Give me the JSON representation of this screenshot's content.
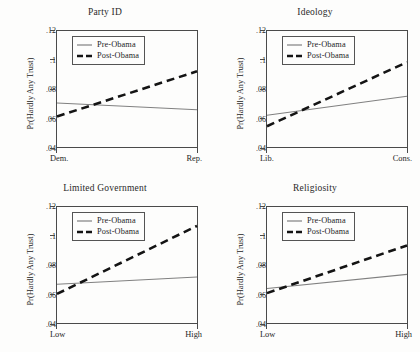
{
  "figure": {
    "legend_labels": {
      "pre": "Pre-Obama",
      "post": "Post-Obama"
    },
    "series_colors": {
      "pre": "#808080",
      "post": "#141414"
    }
  },
  "chart_data": [
    {
      "type": "line",
      "title": "Party ID",
      "xlabel": "",
      "ylabel": "Pr(Hardly Any Trust)",
      "x": [
        0,
        1
      ],
      "xtick_labels": [
        "Dem.",
        "Rep."
      ],
      "ytick_labels": [
        ".04",
        ".06",
        ".08",
        ".1",
        ".12"
      ],
      "ytick_values": [
        0.04,
        0.06,
        0.08,
        0.1,
        0.12
      ],
      "ylim": [
        0.032,
        0.127
      ],
      "grid": false,
      "legend_position": "top-left-inside",
      "series": [
        {
          "name": "Pre-Obama",
          "style": "solid",
          "values": [
            0.068,
            0.0625
          ]
        },
        {
          "name": "Post-Obama",
          "style": "dashed",
          "values": [
            0.057,
            0.094
          ]
        }
      ]
    },
    {
      "type": "line",
      "title": "Ideology",
      "xlabel": "",
      "ylabel": "Pr(Hardly Any Trust)",
      "x": [
        0,
        1
      ],
      "xtick_labels": [
        "Lib.",
        "Cons."
      ],
      "ytick_labels": [
        ".04",
        ".06",
        ".08",
        ".1",
        ".12"
      ],
      "ytick_values": [
        0.04,
        0.06,
        0.08,
        0.1,
        0.12
      ],
      "ylim": [
        0.032,
        0.127
      ],
      "grid": false,
      "legend_position": "top-left-inside",
      "series": [
        {
          "name": "Pre-Obama",
          "style": "solid",
          "values": [
            0.058,
            0.0735
          ]
        },
        {
          "name": "Post-Obama",
          "style": "dashed",
          "values": [
            0.049,
            0.1015
          ]
        }
      ]
    },
    {
      "type": "line",
      "title": "Limited Government",
      "xlabel": "",
      "ylabel": "Pr(Hardly Any Trust)",
      "x": [
        0,
        1
      ],
      "xtick_labels": [
        "Low",
        "High"
      ],
      "ytick_labels": [
        ".04",
        ".06",
        ".08",
        ".1",
        ".12"
      ],
      "ytick_values": [
        0.04,
        0.06,
        0.08,
        0.1,
        0.12
      ],
      "ylim": [
        0.032,
        0.127
      ],
      "grid": false,
      "legend_position": "top-left-inside",
      "series": [
        {
          "name": "Pre-Obama",
          "style": "solid",
          "values": [
            0.0637,
            0.0697
          ]
        },
        {
          "name": "Post-Obama",
          "style": "dashed",
          "values": [
            0.0558,
            0.1115
          ]
        }
      ]
    },
    {
      "type": "line",
      "title": "Religiosity",
      "xlabel": "",
      "ylabel": "Pr(Hardly Any Trust)",
      "x": [
        0,
        1
      ],
      "xtick_labels": [
        "Low",
        "High"
      ],
      "ytick_labels": [
        ".04",
        ".06",
        ".08",
        ".1",
        ".12"
      ],
      "ytick_values": [
        0.04,
        0.06,
        0.08,
        0.1,
        0.12
      ],
      "ylim": [
        0.032,
        0.127
      ],
      "grid": false,
      "legend_position": "top-left-inside",
      "series": [
        {
          "name": "Pre-Obama",
          "style": "solid",
          "values": [
            0.0602,
            0.0718
          ]
        },
        {
          "name": "Post-Obama",
          "style": "dashed",
          "values": [
            0.0565,
            0.0955
          ]
        }
      ]
    }
  ]
}
